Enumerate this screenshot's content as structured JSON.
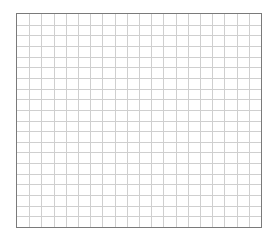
{
  "grid": {
    "columns": 20,
    "rows": 20,
    "line_color": "#cfcfcf",
    "border_color": "#7a7a7a",
    "background": "#ffffff"
  }
}
